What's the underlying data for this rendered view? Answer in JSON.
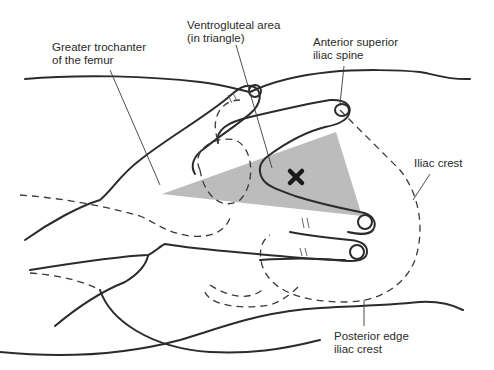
{
  "figure": {
    "colors": {
      "background": "#ffffff",
      "outline": "#2b2b2b",
      "triangle_fill": "#b8b8b8",
      "marker": "#1a1a1a",
      "text": "#2a2a2a"
    },
    "labels": [
      {
        "id": "greater-trochanter",
        "lines": [
          "Greater trochanter",
          "of the femur"
        ]
      },
      {
        "id": "ventrogluteal-area",
        "lines": [
          "Ventrogluteal area",
          "(in triangle)"
        ]
      },
      {
        "id": "anterior-superior-iliac-spine",
        "lines": [
          "Anterior superior",
          "iliac spine"
        ]
      },
      {
        "id": "iliac-crest",
        "lines": [
          "Iliac crest"
        ]
      },
      {
        "id": "posterior-edge-iliac-crest",
        "lines": [
          "Posterior edge",
          "iliac crest"
        ]
      }
    ],
    "marker": {
      "symbol": "✖",
      "meaning": "injection-site-marker"
    }
  }
}
